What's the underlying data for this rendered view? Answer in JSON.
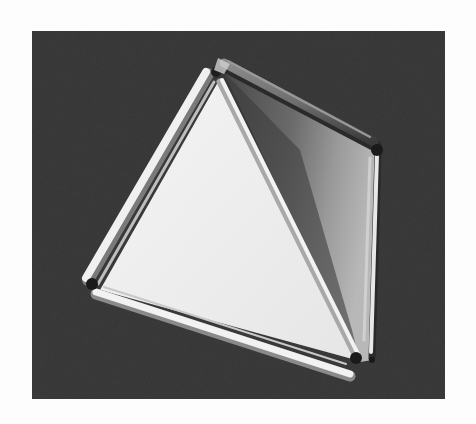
{
  "image": {
    "subject": "tetrahedron model built from rods and translucent panels on a dark background",
    "alt": "Photograph of a tetrahedral frame of white rods with triangular translucent faces, viewed from above on a dark textured surface",
    "colors": {
      "page_background": "#fdfdfd",
      "photo_background": "#3b3b3b",
      "front_face": "#eeeeee",
      "right_face_light": "#8a8a8a",
      "right_face_dark": "#4a4a4a",
      "rod_light": "#f2f2f2",
      "rod_shadow": "#9a9a9a",
      "rod_dark": "#5a5a5a",
      "joint": "#1a1a1a"
    },
    "frame": {
      "x": 32,
      "y": 31,
      "width": 413,
      "height": 368
    }
  }
}
